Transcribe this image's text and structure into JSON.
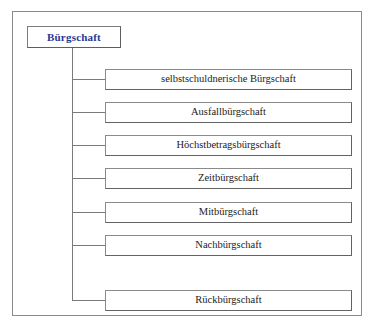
{
  "diagram": {
    "type": "hierarchy-tree",
    "orientation": "vertical-trunk-right-children",
    "background_color": "#ffffff",
    "frame_border_color": "#8b8b8b",
    "connector_color": "#7a7a7a",
    "root": {
      "label": "Bürgschaft",
      "text_color": "#1f3a93",
      "bold": true,
      "border_color": "#7d7d7d"
    },
    "children": [
      {
        "label": "selbstschuldnerische Bürgschaft"
      },
      {
        "label": "Ausfallbürgschaft"
      },
      {
        "label": "Höchstbetragsbürgschaft"
      },
      {
        "label": "Zeitbürgschaft"
      },
      {
        "label": "Mitbürgschaft"
      },
      {
        "label": "Nachbürgschaft"
      },
      {
        "label": "Rückbürgschaft"
      }
    ]
  }
}
